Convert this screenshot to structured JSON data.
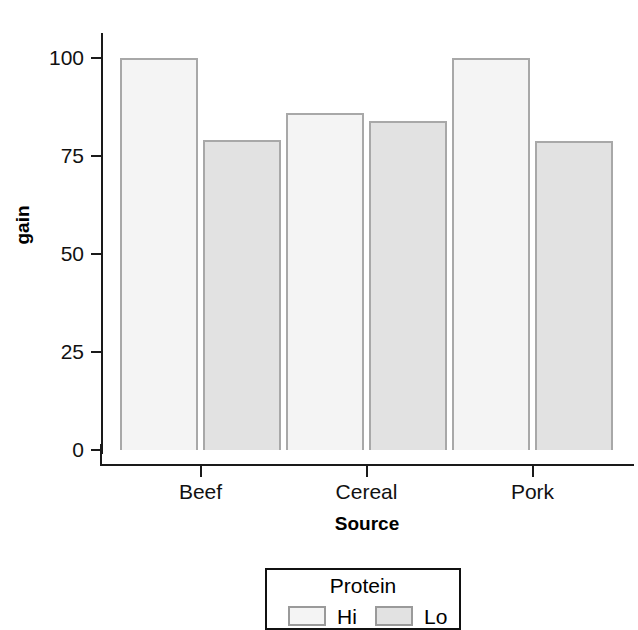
{
  "chart_data": {
    "type": "bar",
    "title": "",
    "subtitle": "",
    "xlabel": "Source",
    "ylabel": "gain",
    "categories": [
      "Beef",
      "Cereal",
      "Pork"
    ],
    "series": [
      {
        "name": "Hi",
        "values": [
          100.0,
          85.9,
          100.0
        ],
        "color": "#f4f4f4"
      },
      {
        "name": "Lo",
        "values": [
          79.2,
          83.9,
          78.7
        ],
        "color": "#e2e2e2"
      }
    ],
    "legend": {
      "title": "Protein",
      "position": "bottom",
      "entries": [
        {
          "label": "Hi",
          "color": "#f4f4f4"
        },
        {
          "label": "Lo",
          "color": "#e2e2e2"
        }
      ]
    },
    "yaxis": {
      "ticks": [
        0,
        25,
        50,
        75,
        100
      ],
      "tick_labels": [
        "0",
        "25",
        "50",
        "75",
        "100"
      ],
      "ylim": [
        0,
        107
      ]
    },
    "xaxis": {
      "tick_labels": [
        "Beef",
        "Cereal",
        "Pork"
      ]
    },
    "grid": false,
    "bar_border_color": "#a8a8a8",
    "axis_color": "#1a1a1a"
  },
  "axes": {
    "y_title": "gain",
    "x_title": "Source",
    "y_ticks": [
      {
        "label": "100",
        "value": 100
      },
      {
        "label": "75",
        "value": 75
      },
      {
        "label": "50",
        "value": 50
      },
      {
        "label": "25",
        "value": 25
      },
      {
        "label": "0",
        "value": 0
      }
    ],
    "x_ticks": [
      {
        "label": "Beef"
      },
      {
        "label": "Cereal"
      },
      {
        "label": "Pork"
      }
    ]
  },
  "legend_box": {
    "title": "Protein",
    "items": [
      {
        "label": "Hi"
      },
      {
        "label": "Lo"
      }
    ]
  }
}
